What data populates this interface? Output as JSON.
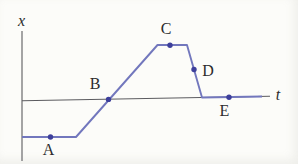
{
  "figure": {
    "background_color": "#fcfcf9",
    "axis_color": "#5b5b5f",
    "curve_color": "#7277bd",
    "dot_color": "#3d3f9b",
    "label_color": "#2b2b2d"
  },
  "chart_data": {
    "type": "line",
    "title": "",
    "xlabel": "t",
    "ylabel": "x",
    "grid": false,
    "legend": "none",
    "axis_ticks": "none (qualitative sketch, unlabeled axes, arbitrary units)",
    "series": [
      {
        "name": "x(t) piecewise-linear curve",
        "points": [
          {
            "t": 0.0,
            "x": -1.0
          },
          {
            "t": 2.2,
            "x": -1.0
          },
          {
            "t": 5.4,
            "x": 1.4
          },
          {
            "t": 6.6,
            "x": 1.4
          },
          {
            "t": 7.2,
            "x": 0.0
          },
          {
            "t": 9.6,
            "x": 0.0
          }
        ],
        "units": "arbitrary (axes unlabeled)"
      }
    ],
    "labeled_points": [
      {
        "label": "A",
        "t": 1.1,
        "x": -1.0,
        "segment": "constant negative x"
      },
      {
        "label": "B",
        "t": 3.5,
        "x": 0.0,
        "segment": "rising, crossing the t-axis"
      },
      {
        "label": "C",
        "t": 5.9,
        "x": 1.4,
        "segment": "constant maximum x"
      },
      {
        "label": "D",
        "t": 6.9,
        "x": 0.7,
        "segment": "falling"
      },
      {
        "label": "E",
        "t": 8.3,
        "x": 0.0,
        "segment": "constant at x = 0"
      }
    ],
    "pixel_geometry": {
      "dot_radius": 2.7,
      "curve_points": "22,137 76,137 157.5,45 187,45 202,97.5 262,96.5",
      "x_axis": {
        "x1": 22,
        "y1": 31,
        "x2": 22,
        "y2": 161
      },
      "t_axis": {
        "x1": 22,
        "y1": 100.8,
        "x2": 270,
        "y2": 96.3
      },
      "x_label": {
        "x": 21.5,
        "y": 26
      },
      "t_label": {
        "x": 278,
        "y": 100
      },
      "dots": [
        {
          "name": "A",
          "cx": 50.5,
          "cy": 137,
          "label_x": 48.5,
          "label_y": 155
        },
        {
          "name": "B",
          "cx": 108.5,
          "cy": 99.4,
          "label_x": 95,
          "label_y": 89
        },
        {
          "name": "C",
          "cx": 170,
          "cy": 45.3,
          "label_x": 166,
          "label_y": 34
        },
        {
          "name": "D",
          "cx": 194,
          "cy": 69.5,
          "label_x": 208,
          "label_y": 76
        },
        {
          "name": "E",
          "cx": 229,
          "cy": 97.3,
          "label_x": 224.5,
          "label_y": 115.5
        }
      ]
    }
  }
}
